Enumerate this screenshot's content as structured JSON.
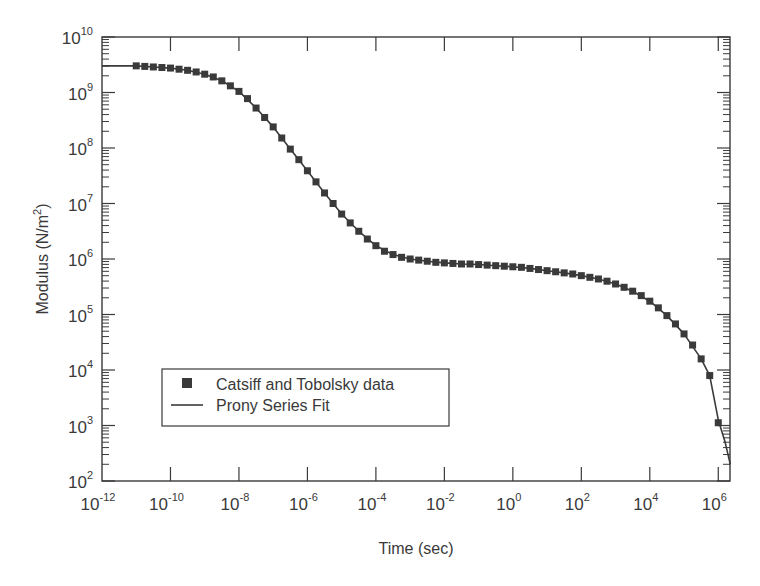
{
  "chart_data": {
    "type": "scatter",
    "title": "",
    "xlabel": "Time (sec)",
    "ylabel": "Modulus (N/m^2)",
    "xscale": "log",
    "yscale": "log",
    "xlim": [
      1e-12,
      2200000.0
    ],
    "ylim": [
      100.0,
      10000000000.0
    ],
    "grid": false,
    "legend_position": "lower left (inside)",
    "x_tick_labels": [
      "10^-12",
      "10^-10",
      "10^-8",
      "10^-6",
      "10^-4",
      "10^-2",
      "10^0",
      "10^2",
      "10^4",
      "10^6"
    ],
    "x_ticks_exp": [
      -12,
      -10,
      -8,
      -6,
      -4,
      -2,
      0,
      2,
      4,
      6
    ],
    "y_tick_labels": [
      "10^2",
      "10^3",
      "10^4",
      "10^5",
      "10^6",
      "10^7",
      "10^8",
      "10^9",
      "10^10"
    ],
    "y_ticks_exp": [
      2,
      3,
      4,
      5,
      6,
      7,
      8,
      9,
      10
    ],
    "series": [
      {
        "name": "Catsiff and Tobolsky data",
        "style": "marker-square",
        "color": "#3a3a3a",
        "log10_x": [
          -11.0,
          -10.75,
          -10.5,
          -10.25,
          -10.0,
          -9.75,
          -9.5,
          -9.25,
          -9.0,
          -8.75,
          -8.5,
          -8.25,
          -8.0,
          -7.75,
          -7.5,
          -7.25,
          -7.0,
          -6.75,
          -6.5,
          -6.25,
          -6.0,
          -5.75,
          -5.5,
          -5.25,
          -5.0,
          -4.75,
          -4.5,
          -4.25,
          -4.0,
          -3.75,
          -3.5,
          -3.25,
          -3.0,
          -2.75,
          -2.5,
          -2.25,
          -2.0,
          -1.75,
          -1.5,
          -1.25,
          -1.0,
          -0.75,
          -0.5,
          -0.25,
          0.0,
          0.25,
          0.5,
          0.75,
          1.0,
          1.25,
          1.5,
          1.75,
          2.0,
          2.25,
          2.5,
          2.75,
          3.0,
          3.25,
          3.5,
          3.75,
          4.0,
          4.25,
          4.5,
          4.75,
          5.0,
          5.25,
          5.5,
          5.75,
          6.0
        ],
        "log10_y": [
          9.48,
          9.47,
          9.46,
          9.45,
          9.44,
          9.42,
          9.4,
          9.37,
          9.33,
          9.28,
          9.21,
          9.12,
          9.02,
          8.89,
          8.72,
          8.55,
          8.38,
          8.18,
          7.98,
          7.79,
          7.59,
          7.39,
          7.19,
          7.0,
          6.81,
          6.65,
          6.5,
          6.36,
          6.24,
          6.14,
          6.08,
          6.03,
          6.0,
          5.98,
          5.96,
          5.94,
          5.93,
          5.92,
          5.91,
          5.91,
          5.9,
          5.89,
          5.88,
          5.87,
          5.86,
          5.85,
          5.83,
          5.81,
          5.79,
          5.77,
          5.75,
          5.73,
          5.7,
          5.67,
          5.64,
          5.6,
          5.55,
          5.49,
          5.42,
          5.34,
          5.24,
          5.12,
          4.98,
          4.83,
          4.65,
          4.45,
          4.2,
          3.9,
          3.05
        ]
      },
      {
        "name": "Prony Series Fit",
        "style": "line",
        "color": "#3a3a3a",
        "log10_x": [
          -12.0,
          -11.0,
          -10.5,
          -10.0,
          -9.5,
          -9.0,
          -8.5,
          -8.0,
          -7.5,
          -7.0,
          -6.5,
          -6.0,
          -5.5,
          -5.0,
          -4.5,
          -4.0,
          -3.5,
          -3.0,
          -2.5,
          -2.0,
          -1.5,
          -1.0,
          -0.5,
          0.0,
          0.5,
          1.0,
          1.5,
          2.0,
          2.5,
          3.0,
          3.5,
          4.0,
          4.5,
          5.0,
          5.5,
          5.75,
          6.0,
          6.2,
          6.35
        ],
        "log10_y": [
          9.48,
          9.48,
          9.46,
          9.44,
          9.4,
          9.33,
          9.21,
          9.02,
          8.72,
          8.38,
          7.98,
          7.59,
          7.19,
          6.81,
          6.5,
          6.24,
          6.08,
          6.0,
          5.96,
          5.93,
          5.91,
          5.9,
          5.88,
          5.86,
          5.83,
          5.79,
          5.75,
          5.7,
          5.64,
          5.55,
          5.42,
          5.24,
          4.98,
          4.65,
          4.2,
          3.9,
          3.1,
          2.7,
          2.3
        ]
      }
    ]
  },
  "axes": {
    "x_title": "Time (sec)",
    "y_title_main": "Modulus (N/m",
    "y_title_sup": "2",
    "y_title_end": ")"
  },
  "legend": {
    "items": [
      {
        "label": "Catsiff and Tobolsky data",
        "symbol": "square"
      },
      {
        "label": "Prony Series Fit",
        "symbol": "line"
      }
    ]
  },
  "colors": {
    "ink": "#3a3a3a",
    "background": "#ffffff"
  }
}
